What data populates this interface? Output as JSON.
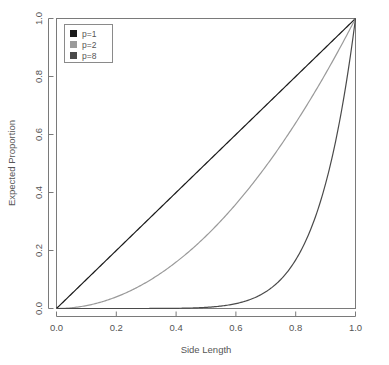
{
  "chart_data": {
    "type": "line",
    "title": "",
    "xlabel": "Side Length",
    "ylabel": "Expected Proportion",
    "xlim": [
      0.0,
      1.0
    ],
    "ylim": [
      0.0,
      1.0
    ],
    "grid": false,
    "legend_position": "top-left",
    "x_ticks": [
      "0.0",
      "0.2",
      "0.4",
      "0.6",
      "0.8",
      "1.0"
    ],
    "x_tick_values": [
      0.0,
      0.2,
      0.4,
      0.6,
      0.8,
      1.0
    ],
    "y_ticks": [
      "0.0",
      "0.2",
      "0.4",
      "0.6",
      "0.8",
      "1.0"
    ],
    "y_tick_values": [
      0.0,
      0.2,
      0.4,
      0.6,
      0.8,
      1.0
    ],
    "x": [
      0.0,
      0.05,
      0.1,
      0.15,
      0.2,
      0.25,
      0.3,
      0.35,
      0.4,
      0.45,
      0.5,
      0.55,
      0.6,
      0.65,
      0.7,
      0.75,
      0.8,
      0.85,
      0.9,
      0.95,
      1.0
    ],
    "series": [
      {
        "name": "p=1",
        "exponent": 1,
        "color": "#1a1a1a",
        "values": [
          0.0,
          0.05,
          0.1,
          0.15,
          0.2,
          0.25,
          0.3,
          0.35,
          0.4,
          0.45,
          0.5,
          0.55,
          0.6,
          0.65,
          0.7,
          0.75,
          0.8,
          0.85,
          0.9,
          0.95,
          1.0
        ]
      },
      {
        "name": "p=2",
        "exponent": 2,
        "color": "#9a9a9a",
        "values": [
          0.0,
          0.0025,
          0.01,
          0.0225,
          0.04,
          0.0625,
          0.09,
          0.1225,
          0.16,
          0.2025,
          0.25,
          0.3025,
          0.36,
          0.4225,
          0.49,
          0.5625,
          0.64,
          0.7225,
          0.81,
          0.9025,
          1.0
        ]
      },
      {
        "name": "p=8",
        "exponent": 8,
        "color": "#4a4a4a",
        "values": [
          0.0,
          0.0,
          0.0,
          2.6e-06,
          2.56e-05,
          0.00015,
          0.00066,
          0.00225,
          0.00655,
          0.0168,
          0.0039,
          0.0084,
          0.0168,
          0.0319,
          0.0576,
          0.1001,
          0.1678,
          0.2725,
          0.4305,
          0.6634,
          1.0
        ]
      }
    ],
    "legend_entries": [
      {
        "label": "p=1",
        "swatch_color": "#1a1a1a"
      },
      {
        "label": "p=2",
        "swatch_color": "#9a9a9a"
      },
      {
        "label": "p=8",
        "swatch_color": "#4a4a4a"
      }
    ]
  }
}
